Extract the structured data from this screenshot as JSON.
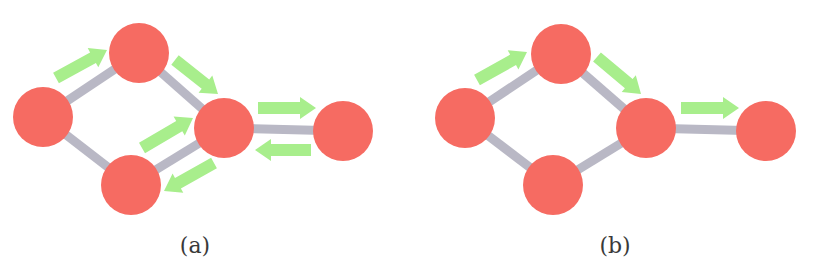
{
  "figure": {
    "panels": [
      {
        "id": "a",
        "label": "(a)",
        "nodes": [
          "n1",
          "n2",
          "n3",
          "n4",
          "n5"
        ],
        "edges": [
          [
            "n1",
            "n2"
          ],
          [
            "n1",
            "n3"
          ],
          [
            "n2",
            "n4"
          ],
          [
            "n3",
            "n4"
          ],
          [
            "n4",
            "n5"
          ]
        ],
        "flows": [
          [
            "n1",
            "n2"
          ],
          [
            "n2",
            "n4"
          ],
          [
            "n3",
            "n4"
          ],
          [
            "n4",
            "n3"
          ],
          [
            "n4",
            "n5"
          ],
          [
            "n5",
            "n4"
          ]
        ]
      },
      {
        "id": "b",
        "label": "(b)",
        "nodes": [
          "n1",
          "n2",
          "n3",
          "n4",
          "n5"
        ],
        "edges": [
          [
            "n1",
            "n2"
          ],
          [
            "n1",
            "n3"
          ],
          [
            "n2",
            "n4"
          ],
          [
            "n3",
            "n4"
          ],
          [
            "n4",
            "n5"
          ]
        ],
        "flows": [
          [
            "n1",
            "n2"
          ],
          [
            "n2",
            "n4"
          ],
          [
            "n4",
            "n5"
          ]
        ]
      }
    ],
    "colors": {
      "node": "#f66b62",
      "edge": "#b9b8c5",
      "arrow": "#a8ee8c",
      "label": "#3a3a3a"
    }
  }
}
